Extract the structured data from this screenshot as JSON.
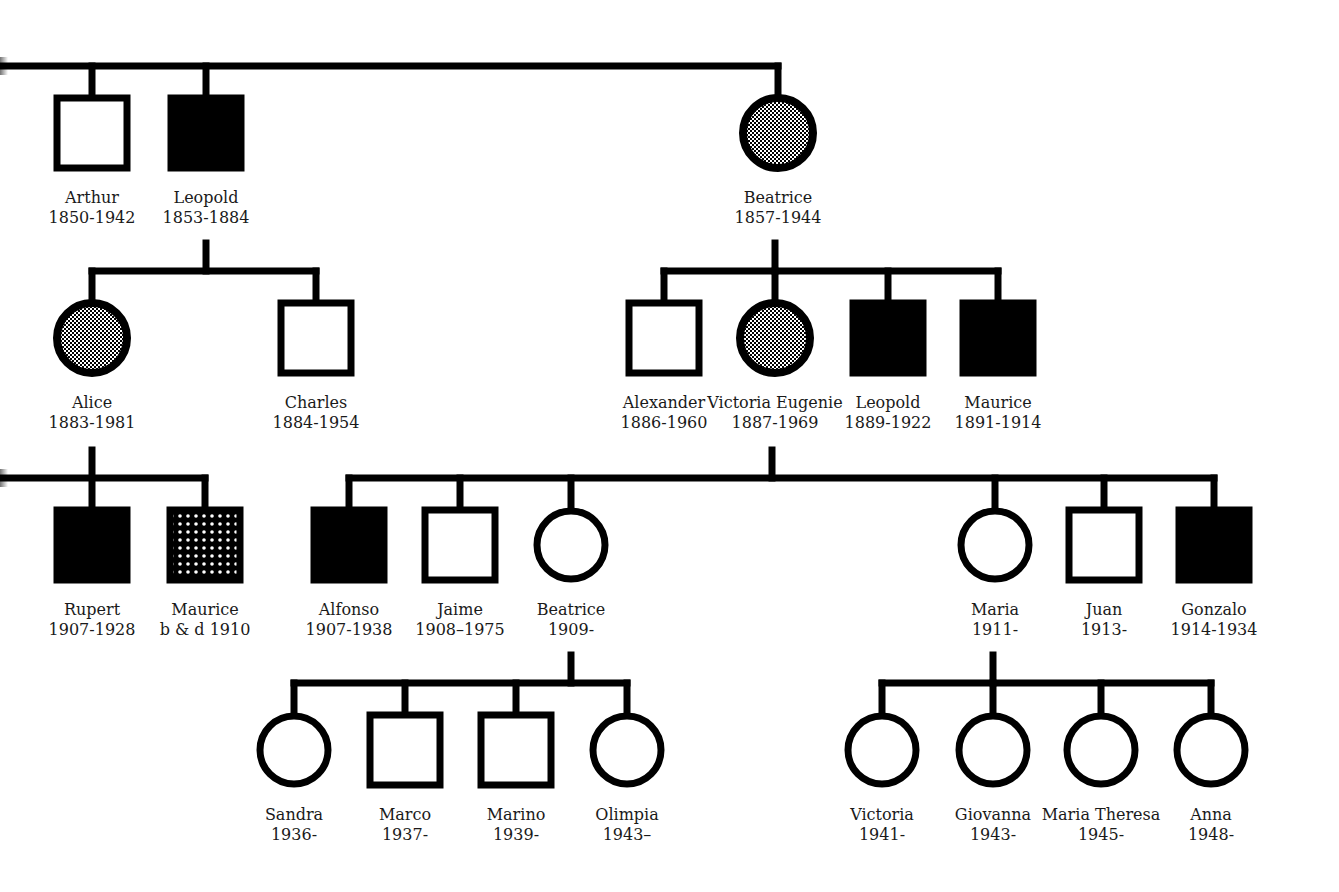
{
  "colors": {
    "line": "#000000",
    "affected": "#000000",
    "background": "#ffffff"
  },
  "legend_semantics": {
    "square": "male",
    "circle": "female",
    "filled": "affected",
    "stippled_circle": "carrier",
    "dotted_square": "uncertain / presumed affected"
  },
  "individuals": [
    {
      "id": "arthur",
      "name": "Arthur",
      "dates": "1850-1942",
      "sex": "male",
      "status": "unaffected",
      "x": 92,
      "y": 133
    },
    {
      "id": "leopold1",
      "name": "Leopold",
      "dates": "1853-1884",
      "sex": "male",
      "status": "affected",
      "x": 206,
      "y": 133
    },
    {
      "id": "beatrice1",
      "name": "Beatrice",
      "dates": "1857-1944",
      "sex": "female",
      "status": "carrier",
      "x": 778,
      "y": 133
    },
    {
      "id": "alice",
      "name": "Alice",
      "dates": "1883-1981",
      "sex": "female",
      "status": "carrier",
      "x": 92,
      "y": 338
    },
    {
      "id": "charles",
      "name": "Charles",
      "dates": "1884-1954",
      "sex": "male",
      "status": "unaffected",
      "x": 316,
      "y": 338
    },
    {
      "id": "alexander",
      "name": "Alexander",
      "dates": "1886-1960",
      "sex": "male",
      "status": "unaffected",
      "x": 664,
      "y": 338
    },
    {
      "id": "victoria_eugenie",
      "name": "Victoria Eugenie",
      "dates": "1887-1969",
      "sex": "female",
      "status": "carrier",
      "x": 775,
      "y": 338
    },
    {
      "id": "leopold2",
      "name": "Leopold",
      "dates": "1889-1922",
      "sex": "male",
      "status": "affected",
      "x": 888,
      "y": 338
    },
    {
      "id": "maurice1",
      "name": "Maurice",
      "dates": "1891-1914",
      "sex": "male",
      "status": "affected",
      "x": 998,
      "y": 338
    },
    {
      "id": "rupert",
      "name": "Rupert",
      "dates": "1907-1928",
      "sex": "male",
      "status": "affected",
      "x": 92,
      "y": 545
    },
    {
      "id": "maurice2",
      "name": "Maurice",
      "dates": "b & d 1910",
      "sex": "male",
      "status": "dotted",
      "x": 205,
      "y": 545
    },
    {
      "id": "alfonso",
      "name": "Alfonso",
      "dates": "1907-1938",
      "sex": "male",
      "status": "affected",
      "x": 349,
      "y": 545
    },
    {
      "id": "jaime",
      "name": "Jaime",
      "dates": "1908–1975",
      "sex": "male",
      "status": "unaffected",
      "x": 460,
      "y": 545
    },
    {
      "id": "beatrice2",
      "name": "Beatrice",
      "dates": "1909-",
      "sex": "female",
      "status": "unaffected",
      "x": 571,
      "y": 545
    },
    {
      "id": "maria",
      "name": "Maria",
      "dates": "1911-",
      "sex": "female",
      "status": "unaffected",
      "x": 995,
      "y": 545
    },
    {
      "id": "juan",
      "name": "Juan",
      "dates": "1913-",
      "sex": "male",
      "status": "unaffected",
      "x": 1104,
      "y": 545
    },
    {
      "id": "gonzalo",
      "name": "Gonzalo",
      "dates": "1914-1934",
      "sex": "male",
      "status": "affected",
      "x": 1214,
      "y": 545
    },
    {
      "id": "sandra",
      "name": "Sandra",
      "dates": "1936-",
      "sex": "female",
      "status": "unaffected",
      "x": 294,
      "y": 750
    },
    {
      "id": "marco",
      "name": "Marco",
      "dates": "1937-",
      "sex": "male",
      "status": "unaffected",
      "x": 405,
      "y": 750
    },
    {
      "id": "marino",
      "name": "Marino",
      "dates": "1939-",
      "sex": "male",
      "status": "unaffected",
      "x": 516,
      "y": 750
    },
    {
      "id": "olimpia",
      "name": "Olimpia",
      "dates": "1943–",
      "sex": "female",
      "status": "unaffected",
      "x": 627,
      "y": 750
    },
    {
      "id": "victoria2",
      "name": "Victoria",
      "dates": "1941-",
      "sex": "female",
      "status": "unaffected",
      "x": 882,
      "y": 750
    },
    {
      "id": "giovanna",
      "name": "Giovanna",
      "dates": "1943-",
      "sex": "female",
      "status": "unaffected",
      "x": 993,
      "y": 750
    },
    {
      "id": "maria_theresa",
      "name": "Maria Theresa",
      "dates": "1945-",
      "sex": "female",
      "status": "unaffected",
      "x": 1101,
      "y": 750
    },
    {
      "id": "anna",
      "name": "Anna",
      "dates": "1948-",
      "sex": "female",
      "status": "unaffected",
      "x": 1211,
      "y": 750
    }
  ],
  "lines": [
    [
      0,
      66,
      778,
      66
    ],
    [
      92,
      66,
      92,
      97
    ],
    [
      206,
      66,
      206,
      97
    ],
    [
      778,
      66,
      778,
      95
    ],
    [
      206,
      243,
      206,
      271
    ],
    [
      92,
      271,
      316,
      271
    ],
    [
      92,
      271,
      92,
      301
    ],
    [
      316,
      271,
      316,
      301
    ],
    [
      775,
      243,
      775,
      271
    ],
    [
      664,
      271,
      998,
      271
    ],
    [
      664,
      271,
      664,
      301
    ],
    [
      775,
      271,
      775,
      300
    ],
    [
      888,
      271,
      888,
      301
    ],
    [
      998,
      271,
      998,
      301
    ],
    [
      92,
      450,
      92,
      508
    ],
    [
      0,
      478,
      205,
      478
    ],
    [
      205,
      478,
      205,
      508
    ],
    [
      772,
      450,
      772,
      478
    ],
    [
      349,
      478,
      1214,
      478
    ],
    [
      349,
      478,
      349,
      508
    ],
    [
      460,
      478,
      460,
      508
    ],
    [
      571,
      478,
      571,
      507
    ],
    [
      995,
      478,
      995,
      507
    ],
    [
      1104,
      478,
      1104,
      508
    ],
    [
      1214,
      478,
      1214,
      508
    ],
    [
      571,
      655,
      571,
      683
    ],
    [
      294,
      683,
      627,
      683
    ],
    [
      294,
      683,
      294,
      712
    ],
    [
      405,
      683,
      405,
      714
    ],
    [
      516,
      683,
      516,
      714
    ],
    [
      627,
      683,
      627,
      712
    ],
    [
      993,
      655,
      993,
      683
    ],
    [
      882,
      683,
      1211,
      683
    ],
    [
      882,
      683,
      882,
      712
    ],
    [
      993,
      683,
      993,
      712
    ],
    [
      1101,
      683,
      1101,
      712
    ],
    [
      1211,
      683,
      1211,
      712
    ]
  ]
}
